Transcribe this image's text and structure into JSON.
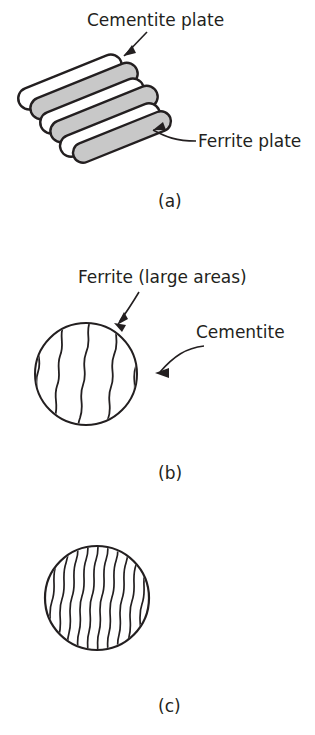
{
  "figure": {
    "background_color": "#ffffff",
    "line_color": "#231f20",
    "cementite_fill": "#c8c8c8",
    "ferrite_fill": "#ffffff"
  },
  "panel_a": {
    "caption": "(a)",
    "label_cementite": "Cementite plate",
    "label_ferrite": "Ferrite plate",
    "plate_count": 6,
    "plates": [
      {
        "kind": "ferrite",
        "fill": "#ffffff"
      },
      {
        "kind": "cementite",
        "fill": "#c8c8c8"
      },
      {
        "kind": "ferrite",
        "fill": "#ffffff"
      },
      {
        "kind": "cementite",
        "fill": "#c8c8c8"
      },
      {
        "kind": "ferrite",
        "fill": "#ffffff"
      },
      {
        "kind": "cementite",
        "fill": "#c8c8c8"
      }
    ]
  },
  "panel_b": {
    "caption": "(b)",
    "label_ferrite": "Ferrite (large areas)",
    "label_cementite": "Cementite",
    "lamella_count": 5,
    "description": "coarse pearlite"
  },
  "panel_c": {
    "caption": "(c)",
    "lamella_count": 21,
    "description": "fine pearlite"
  }
}
